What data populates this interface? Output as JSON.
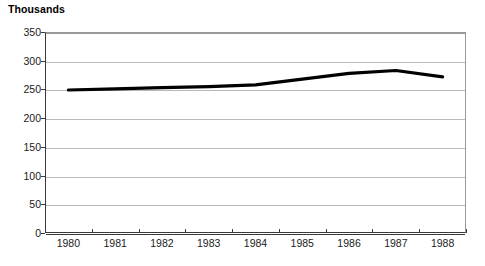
{
  "chart_data": {
    "type": "line",
    "title": "Thousands",
    "xlabel": "",
    "ylabel": "",
    "categories": [
      "1980",
      "1981",
      "1982",
      "1983",
      "1984",
      "1985",
      "1986",
      "1987",
      "1988"
    ],
    "series": [
      {
        "name": "Thousands",
        "values": [
          249,
          251,
          253,
          255,
          258,
          268,
          278,
          283,
          272
        ],
        "color": "#000000",
        "line_width_px": 3.2
      }
    ],
    "ylim": [
      0,
      350
    ],
    "yticks": [
      0,
      50,
      100,
      150,
      200,
      250,
      300,
      350
    ],
    "ytick_labels": [
      "0",
      "50",
      "100",
      "150",
      "200",
      "250",
      "300",
      "350"
    ],
    "grid": true,
    "grid_axis": "y",
    "grid_color": "#b9b9b9",
    "axis_color": "#3a3a3a",
    "legend": false,
    "legend_position": "none",
    "background": "#ffffff"
  }
}
